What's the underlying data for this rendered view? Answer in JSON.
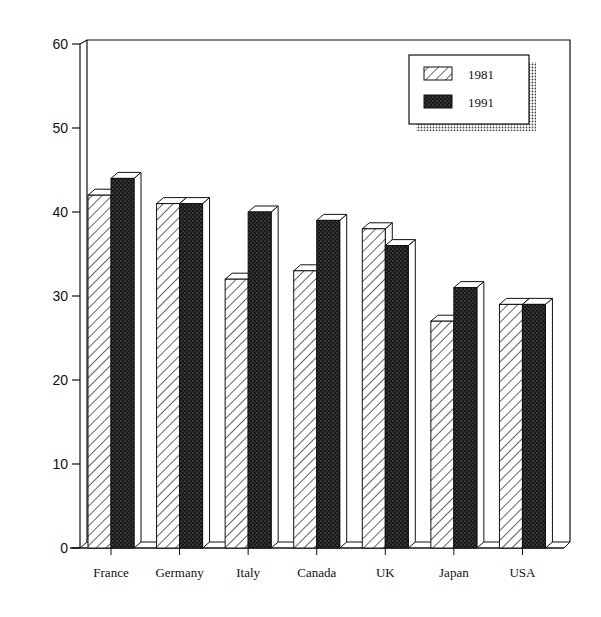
{
  "chart_data": {
    "type": "bar",
    "style": "3d-grouped",
    "title": "",
    "xlabel": "",
    "ylabel": "",
    "ylim": [
      0,
      60
    ],
    "yticks": [
      0,
      10,
      20,
      30,
      40,
      50,
      60
    ],
    "grid": false,
    "legend_position": "top-right",
    "categories": [
      "France",
      "Germany",
      "Italy",
      "Canada",
      "UK",
      "Japan",
      "USA"
    ],
    "series": [
      {
        "name": "1981",
        "pattern": "diagonal-hatch",
        "values": [
          42,
          41,
          32,
          33,
          38,
          27,
          29
        ]
      },
      {
        "name": "1991",
        "pattern": "dark-stipple",
        "values": [
          44,
          41,
          40,
          39,
          36,
          31,
          29
        ]
      }
    ]
  },
  "legend": {
    "items": [
      {
        "label": "1981",
        "pattern": "diagonal-hatch"
      },
      {
        "label": "1991",
        "pattern": "dark-stipple"
      }
    ]
  },
  "colors": {
    "ink": "#111111",
    "background": "#ffffff",
    "stipple": "#2a2a2a"
  }
}
